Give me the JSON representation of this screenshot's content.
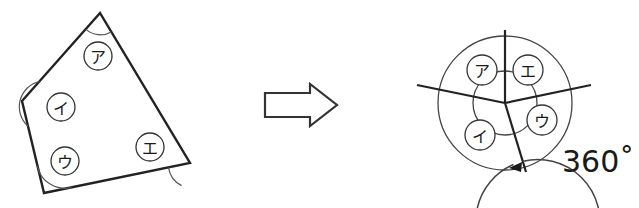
{
  "figure": {
    "colors": {
      "stroke": "#222222",
      "thin_stroke": "#444444",
      "arc_mark": "#555555",
      "label_text": "#1a1a1a",
      "background": "#ffffff"
    },
    "left_shape": {
      "name": "quadrilateral",
      "vertices": [
        {
          "name": "top",
          "x": 100,
          "y": 13
        },
        {
          "name": "left",
          "x": 22,
          "y": 101
        },
        {
          "name": "bottom-left",
          "x": 44,
          "y": 193
        },
        {
          "name": "right",
          "x": 190,
          "y": 163
        }
      ],
      "angle_arcs": [
        {
          "at": "top",
          "radius": 22
        },
        {
          "at": "left",
          "radius": 26
        },
        {
          "at": "bottom-left",
          "radius": 28
        },
        {
          "at": "right",
          "radius": 24
        }
      ],
      "labels": [
        {
          "text": "ア",
          "x": 98,
          "y": 56,
          "r": 14
        },
        {
          "text": "イ",
          "x": 61,
          "y": 107,
          "r": 14
        },
        {
          "text": "ウ",
          "x": 65,
          "y": 161,
          "r": 14
        },
        {
          "text": "エ",
          "x": 150,
          "y": 147,
          "r": 14
        }
      ]
    },
    "arrow": {
      "name": "implies-arrow",
      "x": 265,
      "y": 84,
      "width": 72,
      "height": 42
    },
    "right_shape": {
      "name": "angle-sum-circle",
      "center": {
        "x": 505,
        "y": 103
      },
      "outer_radius": 67,
      "inner_radius": 32,
      "rays": [
        {
          "name": "ray-up",
          "angle_deg": 90,
          "length": 73
        },
        {
          "name": "ray-upper-left",
          "angle_deg": 168,
          "length": 90
        },
        {
          "name": "ray-right",
          "angle_deg": 12,
          "length": 88
        },
        {
          "name": "ray-down",
          "angle_deg": -73,
          "length": 72
        }
      ],
      "sweep_arc": {
        "name": "360-degree-sweep",
        "radius": 62,
        "start_angle_deg": -73,
        "end_angle_deg": 190,
        "arrow_at": "end"
      },
      "labels": [
        {
          "text": "ア",
          "x": 482,
          "y": 70,
          "r": 15
        },
        {
          "text": "エ",
          "x": 528,
          "y": 70,
          "r": 15
        },
        {
          "text": "ウ",
          "x": 542,
          "y": 120,
          "r": 15
        },
        {
          "text": "イ",
          "x": 480,
          "y": 135,
          "r": 15
        }
      ],
      "degree_label": {
        "text": "360˚",
        "x": 562,
        "y": 172
      }
    }
  }
}
